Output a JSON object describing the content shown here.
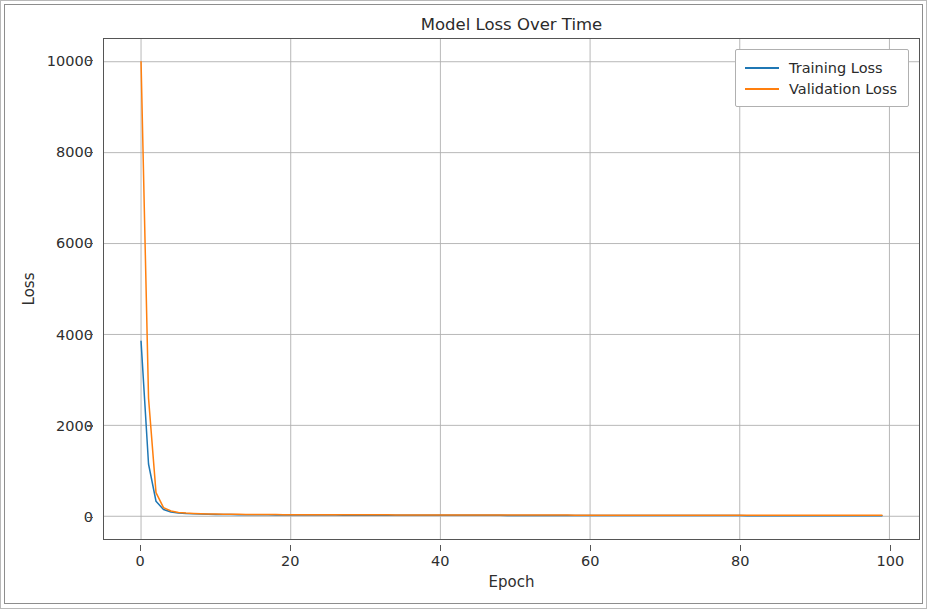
{
  "figure": {
    "background_color": "#ffffff",
    "border_color": "#8d8d8d"
  },
  "chart_data": {
    "type": "line",
    "title": "Model Loss Over Time",
    "xlabel": "Epoch",
    "ylabel": "Loss",
    "xlim": [
      -4.95,
      103.95
    ],
    "ylim": [
      -500,
      10500
    ],
    "xticks": [
      0,
      20,
      40,
      60,
      80,
      100
    ],
    "xtick_labels": [
      "0",
      "20",
      "40",
      "60",
      "80",
      "100"
    ],
    "yticks": [
      0,
      2000,
      4000,
      6000,
      8000,
      10000
    ],
    "ytick_labels": [
      "0",
      "2000",
      "4000",
      "6000",
      "8000",
      "10000"
    ],
    "grid": true,
    "grid_color": "#b0b0b0",
    "legend_position": "upper right",
    "x": [
      0,
      1,
      2,
      3,
      4,
      5,
      6,
      7,
      8,
      9,
      10,
      11,
      12,
      13,
      14,
      15,
      16,
      17,
      18,
      19,
      20,
      21,
      22,
      23,
      24,
      25,
      26,
      27,
      28,
      29,
      30,
      31,
      32,
      33,
      34,
      35,
      36,
      37,
      38,
      39,
      40,
      41,
      42,
      43,
      44,
      45,
      46,
      47,
      48,
      49,
      50,
      51,
      52,
      53,
      54,
      55,
      56,
      57,
      58,
      59,
      60,
      61,
      62,
      63,
      64,
      65,
      66,
      67,
      68,
      69,
      70,
      71,
      72,
      73,
      74,
      75,
      76,
      77,
      78,
      79,
      80,
      81,
      82,
      83,
      84,
      85,
      86,
      87,
      88,
      89,
      90,
      91,
      92,
      93,
      94,
      95,
      96,
      97,
      98,
      99
    ],
    "series": [
      {
        "name": "Training Loss",
        "color": "#1f77b4",
        "linewidth": 1.5,
        "values": [
          3850,
          1150,
          330,
          150,
          95,
          72,
          60,
          53,
          48,
          44,
          41,
          39,
          37,
          35,
          34,
          33,
          32,
          31,
          30,
          29,
          29,
          28,
          28,
          27,
          27,
          26,
          26,
          25,
          25,
          25,
          24,
          24,
          24,
          23,
          23,
          23,
          22,
          22,
          22,
          22,
          21,
          21,
          21,
          21,
          20,
          20,
          20,
          20,
          20,
          19,
          19,
          19,
          19,
          19,
          18,
          18,
          18,
          18,
          18,
          18,
          17,
          17,
          17,
          17,
          17,
          17,
          16,
          16,
          16,
          16,
          16,
          16,
          16,
          15,
          15,
          15,
          15,
          15,
          15,
          15,
          15,
          14,
          14,
          14,
          14,
          14,
          14,
          14,
          14,
          13,
          13,
          13,
          13,
          13,
          13,
          13,
          13,
          12,
          12,
          12
        ]
      },
      {
        "name": "Validation Loss",
        "color": "#ff7f0e",
        "linewidth": 1.5,
        "values": [
          10000,
          2600,
          520,
          190,
          115,
          85,
          70,
          62,
          56,
          52,
          49,
          46,
          44,
          42,
          41,
          40,
          39,
          38,
          37,
          36,
          36,
          35,
          35,
          34,
          34,
          33,
          33,
          33,
          32,
          32,
          32,
          31,
          31,
          31,
          30,
          30,
          30,
          30,
          29,
          29,
          29,
          29,
          28,
          28,
          28,
          28,
          28,
          27,
          27,
          27,
          27,
          27,
          26,
          26,
          26,
          26,
          26,
          26,
          25,
          25,
          25,
          25,
          25,
          25,
          24,
          24,
          24,
          24,
          24,
          24,
          24,
          23,
          23,
          23,
          23,
          23,
          23,
          23,
          22,
          22,
          22,
          22,
          22,
          22,
          22,
          22,
          21,
          21,
          21,
          21,
          21,
          21,
          21,
          21,
          20,
          20,
          20,
          20,
          20,
          20
        ]
      }
    ]
  },
  "legend": {
    "entries": [
      {
        "label": "Training Loss",
        "color": "#1f77b4"
      },
      {
        "label": "Validation Loss",
        "color": "#ff7f0e"
      }
    ]
  }
}
